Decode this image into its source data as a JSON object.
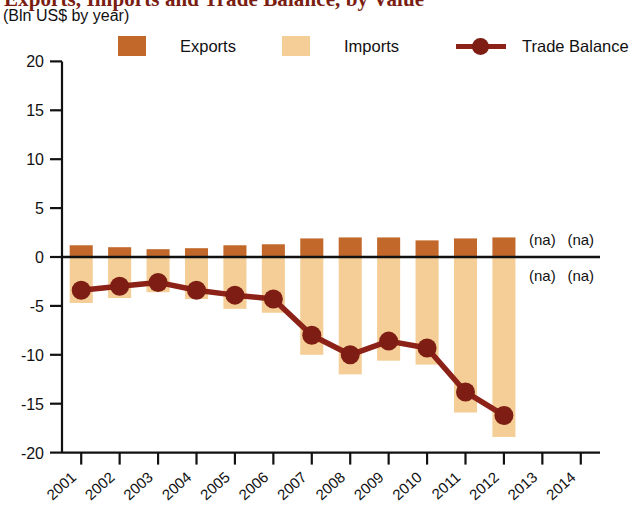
{
  "title": {
    "main": "Exports, Imports and Trade Balance, by Value",
    "sub": "(Bln US$ by year)"
  },
  "legend": {
    "position": "top",
    "items": [
      {
        "label": "Exports",
        "color": "#c2682b",
        "marker": "square"
      },
      {
        "label": "Imports",
        "color": "#f4ce96",
        "marker": "square"
      },
      {
        "label": "Trade Balance",
        "color": "#8c2118",
        "marker": "line-dot"
      }
    ]
  },
  "na_labels": [
    {
      "text": "(na)",
      "year": "2013",
      "side": "above"
    },
    {
      "text": "(na)",
      "year": "2014",
      "side": "above"
    },
    {
      "text": "(na)",
      "year": "2013",
      "side": "below"
    },
    {
      "text": "(na)",
      "year": "2014",
      "side": "below"
    }
  ],
  "chart_data": {
    "type": "bar",
    "title": "Exports, Imports and Trade Balance, by Value",
    "subtitle": "(Bln US$ by year)",
    "xlabel": "",
    "ylabel": "",
    "ylim": [
      -20,
      20
    ],
    "yticks": [
      20,
      15,
      10,
      5,
      0,
      -5,
      -10,
      -15,
      -20
    ],
    "ytick_labels": [
      "20",
      "15",
      "10",
      "5",
      "0",
      "-5",
      "-10",
      "-15",
      "-20"
    ],
    "grid": false,
    "legend_position": "top",
    "categories": [
      "2001",
      "2002",
      "2003",
      "2004",
      "2005",
      "2006",
      "2007",
      "2008",
      "2009",
      "2010",
      "2011",
      "2012",
      "2013",
      "2014"
    ],
    "series": [
      {
        "name": "Exports",
        "type": "bar",
        "color": "#c2682b",
        "values": [
          1.2,
          1.0,
          0.8,
          0.9,
          1.2,
          1.3,
          1.9,
          2.0,
          2.0,
          1.7,
          1.9,
          2.0,
          null,
          null
        ]
      },
      {
        "name": "Imports",
        "type": "bar",
        "color": "#f4ce96",
        "values": [
          -4.7,
          -4.2,
          -3.6,
          -4.3,
          -5.3,
          -5.7,
          -10.0,
          -12.0,
          -10.6,
          -11.0,
          -15.9,
          -18.4,
          null,
          null
        ]
      },
      {
        "name": "Trade Balance",
        "type": "line",
        "color": "#8c2118",
        "values": [
          -3.4,
          -3.0,
          -2.6,
          -3.4,
          -3.9,
          -4.3,
          -8.0,
          -10.0,
          -8.6,
          -9.3,
          -13.8,
          -16.2,
          null,
          null
        ]
      }
    ],
    "notes": [
      "(na) shown for 2013 and 2014 — data not available"
    ]
  }
}
